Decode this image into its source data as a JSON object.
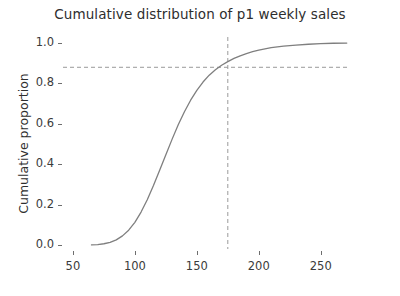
{
  "chart_data": {
    "type": "line",
    "title": "Cumulative distribution of p1 weekly sales",
    "xlabel": "",
    "ylabel": "Cumulative proportion",
    "xlim": [
      42,
      272
    ],
    "ylim": [
      -0.02,
      1.03
    ],
    "grid": false,
    "legend": false,
    "xticks": [
      50,
      100,
      150,
      200,
      250
    ],
    "xtick_labels": [
      "50",
      "100",
      "150",
      "200",
      "250"
    ],
    "yticks": [
      0.0,
      0.2,
      0.4,
      0.6,
      0.8,
      1.0
    ],
    "ytick_labels": [
      "0.0",
      "0.2",
      "0.4",
      "0.6",
      "0.8",
      "1.0"
    ],
    "series": [
      {
        "name": "p1 weekly sales ECDF",
        "color": "#7f7f7f",
        "x": [
          65,
          70,
          75,
          80,
          85,
          90,
          95,
          100,
          105,
          110,
          115,
          120,
          125,
          130,
          135,
          140,
          145,
          150,
          155,
          160,
          165,
          170,
          175,
          180,
          185,
          190,
          195,
          200,
          205,
          210,
          215,
          220,
          230,
          240,
          250,
          260,
          271
        ],
        "y": [
          0.0,
          0.002,
          0.006,
          0.013,
          0.025,
          0.045,
          0.073,
          0.112,
          0.163,
          0.224,
          0.294,
          0.37,
          0.447,
          0.523,
          0.595,
          0.66,
          0.717,
          0.766,
          0.807,
          0.841,
          0.868,
          0.89,
          0.908,
          0.924,
          0.937,
          0.948,
          0.957,
          0.965,
          0.971,
          0.977,
          0.981,
          0.985,
          0.99,
          0.994,
          0.997,
          0.999,
          1.0
        ]
      }
    ],
    "annotations": [
      {
        "name": "vertical-reference-line",
        "orientation": "vertical",
        "value": 175,
        "style": "dashed",
        "color": "#9a9a9a"
      },
      {
        "name": "horizontal-reference-line",
        "orientation": "horizontal",
        "value": 0.88,
        "style": "dashed",
        "color": "#9a9a9a"
      }
    ]
  }
}
